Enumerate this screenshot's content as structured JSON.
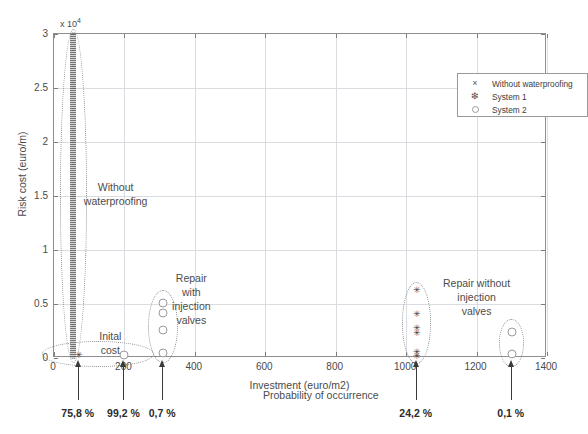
{
  "chart_data": {
    "type": "scatter",
    "title": "",
    "xlabel": "Investment (euro/m2)",
    "ylabel": "Risk cost (euro/m)",
    "y_multiplier": "x 10",
    "y_multiplier_exp": "4",
    "xlim": [
      0,
      1400
    ],
    "ylim": [
      0,
      30000
    ],
    "xticks": [
      "0",
      "200",
      "400",
      "600",
      "800",
      "1000",
      "1200",
      "1400"
    ],
    "xtick_values": [
      0,
      200,
      400,
      600,
      800,
      1000,
      1200,
      1400
    ],
    "yticks": [
      "0",
      "0.5",
      "1",
      "1.5",
      "2",
      "2.5",
      "3"
    ],
    "ytick_values": [
      0,
      5000,
      10000,
      15000,
      20000,
      25000,
      30000
    ],
    "grid": true,
    "legend_position": "top-right",
    "legend": [
      {
        "marker": "x-marker-icon",
        "glyph": "×",
        "label": "Without waterproofing"
      },
      {
        "marker": "asterisk-marker-icon",
        "glyph": "✳",
        "label": "System 1"
      },
      {
        "marker": "open-circle-marker-icon",
        "glyph": "○",
        "label": "System 2"
      }
    ],
    "series": [
      {
        "name": "Without waterproofing",
        "marker": "x",
        "points": [
          {
            "x": 55,
            "y": 30000
          },
          {
            "x": 55,
            "y": 28500
          },
          {
            "x": 55,
            "y": 27000
          },
          {
            "x": 55,
            "y": 25500
          },
          {
            "x": 55,
            "y": 25000
          },
          {
            "x": 55,
            "y": 23000
          },
          {
            "x": 55,
            "y": 21000
          },
          {
            "x": 55,
            "y": 20000
          },
          {
            "x": 55,
            "y": 18000
          },
          {
            "x": 55,
            "y": 16000
          },
          {
            "x": 55,
            "y": 15000
          },
          {
            "x": 55,
            "y": 13000
          },
          {
            "x": 55,
            "y": 11000
          },
          {
            "x": 55,
            "y": 9000
          },
          {
            "x": 55,
            "y": 7000
          },
          {
            "x": 55,
            "y": 5000
          },
          {
            "x": 55,
            "y": 3000
          },
          {
            "x": 55,
            "y": 1000
          },
          {
            "x": 55,
            "y": 0
          }
        ]
      },
      {
        "name": "System 1",
        "marker": "asterisk",
        "points": [
          {
            "x": 70,
            "y": 300
          },
          {
            "x": 1030,
            "y": 6300
          },
          {
            "x": 1030,
            "y": 4100
          },
          {
            "x": 1030,
            "y": 2800
          },
          {
            "x": 1030,
            "y": 2300
          },
          {
            "x": 1030,
            "y": 600
          },
          {
            "x": 1030,
            "y": 200
          }
        ]
      },
      {
        "name": "System 2",
        "marker": "circle",
        "points": [
          {
            "x": 200,
            "y": 300
          },
          {
            "x": 310,
            "y": 5100
          },
          {
            "x": 310,
            "y": 4200
          },
          {
            "x": 310,
            "y": 2600
          },
          {
            "x": 310,
            "y": 500
          },
          {
            "x": 1300,
            "y": 2400
          },
          {
            "x": 1300,
            "y": 400
          }
        ]
      }
    ],
    "groupings": [
      {
        "id": "without-waterproofing-group",
        "label": "Without\nwaterproofing",
        "ellipse": {
          "cx": 55,
          "cy": 15000,
          "rx": 38,
          "ry": 15500
        },
        "label_pos": {
          "x": 175,
          "y": 16500
        }
      },
      {
        "id": "initial-cost-group",
        "label": "Inital\ncost",
        "ellipse": {
          "cx": 125,
          "cy": 400,
          "rx": 160,
          "ry": 1200
        },
        "label_pos": {
          "x": 160,
          "y": 2700
        }
      },
      {
        "id": "repair-with-injection-valves-group",
        "label": "Repair\nwith\ninjection\nvalves",
        "ellipse": {
          "cx": 310,
          "cy": 2900,
          "rx": 42,
          "ry": 3400
        },
        "label_pos": {
          "x": 390,
          "y": 8100
        }
      },
      {
        "id": "repair-without-injection-valves-group",
        "label": "Repair without\ninjection\nvalves",
        "ellipse": {
          "cx": 1030,
          "cy": 3200,
          "rx": 42,
          "ry": 3800
        },
        "label_pos": {
          "x": 1200,
          "y": 7600
        }
      },
      {
        "id": "system2-right-group",
        "label": "",
        "ellipse": {
          "cx": 1300,
          "cy": 1400,
          "rx": 36,
          "ry": 2200
        },
        "label_pos": null
      }
    ],
    "probability_caption": "Probability of occurrence",
    "probabilities": [
      {
        "x": 70,
        "label": "75,8 %"
      },
      {
        "x": 200,
        "label": "99,2 %"
      },
      {
        "x": 310,
        "label": "0,7 %"
      },
      {
        "x": 1030,
        "label": "24,2 %"
      },
      {
        "x": 1300,
        "label": "0,1 %"
      }
    ]
  },
  "colors": {
    "background": "#ffffff",
    "axis": "#8e8e8e",
    "grid": "#d9dde2",
    "text": "#4a4a4a",
    "marker_dark": "#3b3b3b",
    "marker_open": "#9b9b9b",
    "ellipse": "#8f8f8f",
    "arrow": "#3a3a3a"
  }
}
